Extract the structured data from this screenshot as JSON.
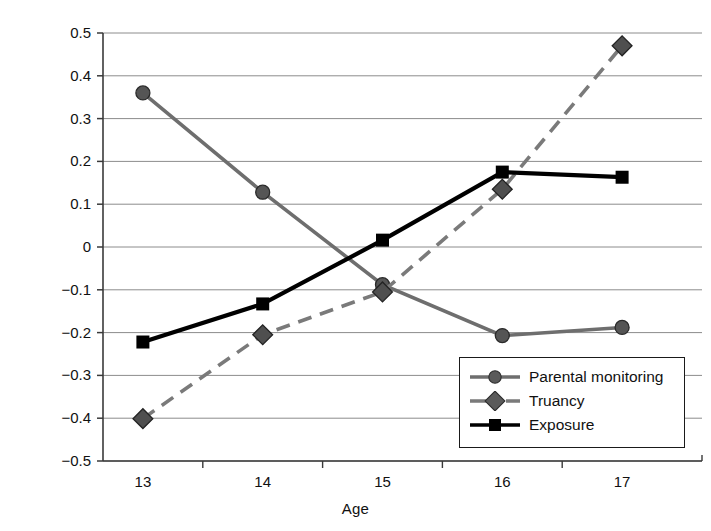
{
  "chart_data": {
    "type": "line",
    "title": "",
    "xlabel": "Age",
    "ylabel": "Mean z-score",
    "categories": [
      "13",
      "14",
      "15",
      "16",
      "17"
    ],
    "x": [
      13,
      14,
      15,
      16,
      17
    ],
    "ylim": [
      -0.5,
      0.5
    ],
    "yticks": [
      "0.5",
      "0.4",
      "0.3",
      "0.2",
      "0.1",
      "0",
      "−0.1",
      "−0.2",
      "−0.3",
      "−0.4",
      "−0.5"
    ],
    "ytick_values": [
      0.5,
      0.4,
      0.3,
      0.2,
      0.1,
      0,
      -0.1,
      -0.2,
      -0.3,
      -0.4,
      -0.5
    ],
    "grid": true,
    "legend_position": "bottom-right",
    "series": [
      {
        "name": "Parental monitoring",
        "values": [
          0.36,
          0.128,
          -0.088,
          -0.207,
          -0.188
        ],
        "marker": "circle",
        "linestyle": "solid",
        "color": "#6e6e6e"
      },
      {
        "name": "Truancy",
        "values": [
          -0.401,
          -0.205,
          -0.105,
          0.135,
          0.47
        ],
        "marker": "diamond",
        "linestyle": "dashed",
        "color": "#7a7a7a"
      },
      {
        "name": "Exposure",
        "values": [
          -0.222,
          -0.133,
          0.016,
          0.175,
          0.163
        ],
        "marker": "square",
        "linestyle": "solid",
        "color": "#000000"
      }
    ]
  },
  "legend": {
    "items": [
      {
        "label": "Parental monitoring",
        "marker": "circle-marker",
        "style": "solid"
      },
      {
        "label": "Truancy",
        "marker": "diamond-marker",
        "style": "dashed"
      },
      {
        "label": "Exposure",
        "marker": "square-marker",
        "style": "solid"
      }
    ]
  },
  "colors": {
    "axis": "#3a3a3a",
    "grid": "#8c8c8c",
    "parental_monitoring": "#6e6e6e",
    "truancy": "#7a7a7a",
    "exposure": "#000000",
    "background": "#ffffff"
  }
}
